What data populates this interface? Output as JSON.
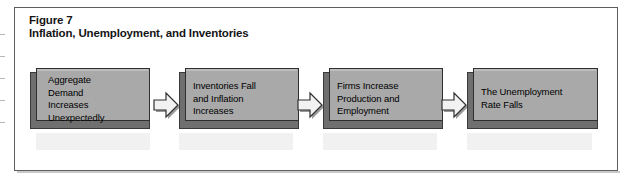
{
  "figure": {
    "label": "Figure 7",
    "title": "Inflation, Unemployment, and Inventories",
    "frame_color": "#5d5d5d",
    "box_fill_color": "#a9a9a9",
    "box_shadow_color": "#6f6f6f",
    "box_border_color": "#2f2f2f",
    "arrow_fill_color": "#f2f2f2",
    "arrow_border_color": "#2f2f2f",
    "text_color": "#000000",
    "background_color": "#ffffff"
  },
  "flow": {
    "steps": [
      {
        "id": "aggregate-demand",
        "text": "Aggregate\nDemand\nIncreases\nUnexpectedly",
        "lines": [
          "Aggregate",
          "Demand",
          "Increases",
          "Unexpectedly"
        ]
      },
      {
        "id": "inventories-inflation",
        "text": "Inventories Fall\nand Inflation\nIncreases",
        "lines": [
          "Inventories Fall",
          "and Inflation",
          "Increases"
        ]
      },
      {
        "id": "firms-production",
        "text": "Firms Increase\nProduction and\nEmployment",
        "lines": [
          "Firms Increase",
          "Production and",
          "Employment"
        ]
      },
      {
        "id": "unemployment-rate",
        "text": "The Unemployment\nRate Falls",
        "lines": [
          "The Unemployment",
          "Rate Falls"
        ]
      }
    ],
    "connectors": [
      {
        "id": "connector-1",
        "icon": "right-block-arrow-icon",
        "direction": "right"
      },
      {
        "id": "connector-2",
        "icon": "right-block-arrow-icon",
        "direction": "right"
      },
      {
        "id": "connector-3",
        "icon": "right-block-arrow-icon",
        "direction": "right"
      }
    ]
  }
}
